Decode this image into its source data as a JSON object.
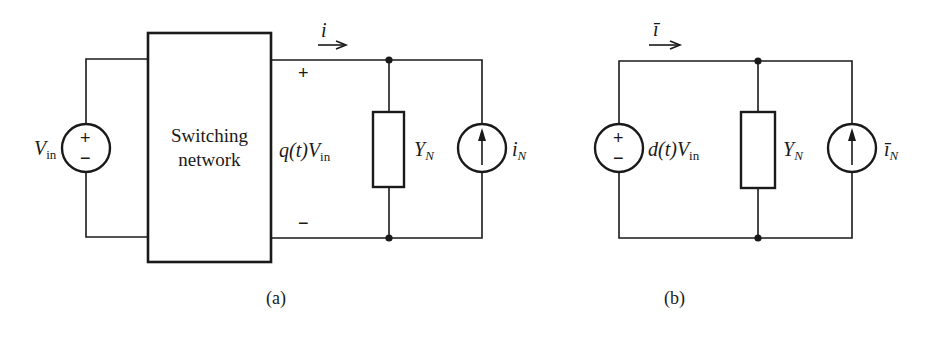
{
  "figure": {
    "panel_a": {
      "caption": "(a)",
      "source_label": {
        "main": "V",
        "sub": "in"
      },
      "source_plus": "+",
      "source_minus": "−",
      "block_label_line1": "Switching",
      "block_label_line2": "network",
      "output_voltage_label": {
        "prefix": "q(t)V",
        "sub": "in"
      },
      "output_plus": "+",
      "output_minus": "−",
      "current_label": "i",
      "admittance_label": {
        "main": "Y",
        "sub": "N"
      },
      "current_source_label": {
        "main": "i",
        "sub": "N"
      }
    },
    "panel_b": {
      "caption": "(b)",
      "source_label": {
        "prefix": "d(t)V",
        "sub": "in"
      },
      "source_plus": "+",
      "source_minus": "−",
      "current_label": "ī",
      "admittance_label": {
        "main": "Y",
        "sub": "N"
      },
      "current_source_label": {
        "main": "ī",
        "sub": "N"
      }
    },
    "colors": {
      "stroke": "#1a1a1a",
      "background": "#ffffff"
    }
  }
}
